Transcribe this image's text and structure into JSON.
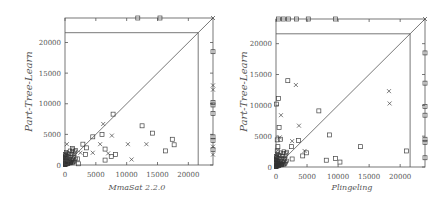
{
  "chart_data": [
    {
      "type": "scatter",
      "title": "",
      "xlabel": "MmaSat 2.2.0",
      "ylabel": "Part-Tree-Learn",
      "xlim": [
        0,
        24000
      ],
      "ylim": [
        0,
        24000
      ],
      "xticks": [
        "0",
        "5000",
        "10000",
        "15000",
        "20000"
      ],
      "yticks": [
        "0",
        "5000",
        "10000",
        "15000",
        "20000"
      ],
      "timeout_line": 21600,
      "diagonal": true,
      "grid": false,
      "series": [
        {
          "name": "SAT",
          "marker": "cross",
          "points": [
            [
              300,
              3400
            ],
            [
              6200,
              6700
            ],
            [
              7600,
              4800
            ],
            [
              5700,
              3400
            ],
            [
              10200,
              3400
            ],
            [
              13200,
              3400
            ],
            [
              4500,
              2000
            ],
            [
              7000,
              1900
            ],
            [
              10800,
              900
            ],
            [
              2500,
              2000
            ],
            [
              1500,
              1800
            ],
            [
              800,
              1200
            ],
            [
              24000,
              24000
            ],
            [
              24000,
              13000
            ],
            [
              24000,
              12300
            ],
            [
              24000,
              3000
            ],
            [
              24000,
              1700
            ]
          ]
        },
        {
          "name": "UNSAT",
          "marker": "square",
          "points": [
            [
              7800,
              8300
            ],
            [
              4500,
              4600
            ],
            [
              6000,
              5000
            ],
            [
              3500,
              2800
            ],
            [
              6500,
              2600
            ],
            [
              2900,
              3400
            ],
            [
              8200,
              1700
            ],
            [
              7500,
              1400
            ],
            [
              6500,
              800
            ],
            [
              12500,
              6400
            ],
            [
              14200,
              5200
            ],
            [
              17400,
              4200
            ],
            [
              17700,
              3300
            ],
            [
              16300,
              2300
            ],
            [
              3300,
              1700
            ],
            [
              2000,
              1000
            ],
            [
              2200,
              200
            ],
            [
              1200,
              2700
            ],
            [
              900,
              1500
            ],
            [
              500,
              900
            ],
            [
              200,
              400
            ],
            [
              11800,
              24000
            ],
            [
              15400,
              24000
            ],
            [
              24000,
              18500
            ],
            [
              24000,
              10200
            ],
            [
              24000,
              9800
            ],
            [
              24000,
              8400
            ],
            [
              24000,
              4600
            ],
            [
              24000,
              4000
            ],
            [
              24000,
              2500
            ]
          ]
        }
      ]
    },
    {
      "type": "scatter",
      "title": "",
      "xlabel": "Plingeling",
      "ylabel": "Part-Tree-Learn",
      "xlim": [
        0,
        24000
      ],
      "ylim": [
        0,
        24000
      ],
      "xticks": [
        "0",
        "5000",
        "10000",
        "15000",
        "20000"
      ],
      "yticks": [
        "0",
        "5000",
        "10000",
        "15000",
        "20000"
      ],
      "timeout_line": 21600,
      "diagonal": true,
      "grid": false,
      "series": [
        {
          "name": "SAT",
          "marker": "cross",
          "points": [
            [
              3200,
              13300
            ],
            [
              18200,
              12300
            ],
            [
              18300,
              10300
            ],
            [
              3700,
              6700
            ],
            [
              2600,
              4200
            ],
            [
              4600,
              2600
            ],
            [
              800,
              8400
            ],
            [
              600,
              4800
            ],
            [
              1000,
              1500
            ],
            [
              300,
              2700
            ],
            [
              24000,
              24000
            ]
          ]
        },
        {
          "name": "UNSAT",
          "marker": "square",
          "points": [
            [
              1900,
              14000
            ],
            [
              6900,
              9100
            ],
            [
              400,
              11100
            ],
            [
              100,
              10200
            ],
            [
              500,
              6400
            ],
            [
              700,
              4500
            ],
            [
              200,
              4400
            ],
            [
              3600,
              4300
            ],
            [
              8600,
              5200
            ],
            [
              2500,
              3300
            ],
            [
              4900,
              2300
            ],
            [
              4300,
              1800
            ],
            [
              2600,
              1300
            ],
            [
              13600,
              3300
            ],
            [
              21000,
              2600
            ],
            [
              8100,
              1100
            ],
            [
              9600,
              1400
            ],
            [
              10300,
              800
            ],
            [
              300,
              3300
            ],
            [
              200,
              2600
            ],
            [
              400,
              1900
            ],
            [
              1300,
              1400
            ],
            [
              400,
              24000
            ],
            [
              1200,
              24000
            ],
            [
              2000,
              24000
            ],
            [
              3300,
              24000
            ],
            [
              5200,
              24000
            ],
            [
              9600,
              24000
            ],
            [
              24000,
              18500
            ],
            [
              24000,
              13600
            ],
            [
              24000,
              9800
            ],
            [
              24000,
              8400
            ],
            [
              24000,
              4500
            ],
            [
              24000,
              4000
            ],
            [
              24000,
              1500
            ]
          ]
        }
      ]
    }
  ]
}
